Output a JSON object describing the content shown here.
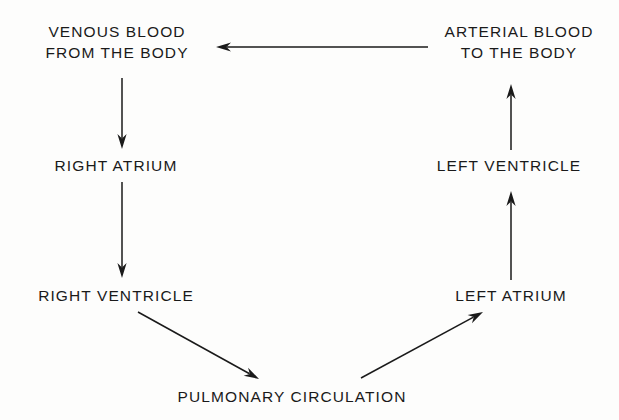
{
  "diagram": {
    "background_color": "#fdfdfc",
    "ink_color": "#1a1a1a",
    "nodes": [
      {
        "id": "venous-blood-from-the-body",
        "name": "node-venous-blood-from-the-body",
        "lines": [
          "VENOUS BLOOD",
          "FROM THE BODY"
        ],
        "text": "VENOUS BLOOD FROM THE BODY",
        "x": 117,
        "y": 42
      },
      {
        "id": "right-atrium",
        "name": "node-right-atrium",
        "lines": [
          "RIGHT ATRIUM"
        ],
        "text": "RIGHT ATRIUM",
        "x": 116,
        "y": 165
      },
      {
        "id": "right-ventricle",
        "name": "node-right-ventricle",
        "lines": [
          "RIGHT VENTRICLE"
        ],
        "text": "RIGHT VENTRICLE",
        "x": 116,
        "y": 295
      },
      {
        "id": "pulmonary-circulation",
        "name": "node-pulmonary-circulation",
        "lines": [
          "PULMONARY CIRCULATION"
        ],
        "text": "PULMONARY CIRCULATION",
        "x": 292,
        "y": 396
      },
      {
        "id": "left-atrium",
        "name": "node-left-atrium",
        "lines": [
          "LEFT ATRIUM"
        ],
        "text": "LEFT ATRIUM",
        "x": 511,
        "y": 295
      },
      {
        "id": "left-ventricle",
        "name": "node-left-ventricle",
        "lines": [
          "LEFT VENTRICLE"
        ],
        "text": "LEFT VENTRICLE",
        "x": 509,
        "y": 165
      },
      {
        "id": "arterial-blood-to-the-body",
        "name": "node-arterial-blood-to-the-body",
        "lines": [
          "ARTERIAL BLOOD",
          "TO THE BODY"
        ],
        "text": "ARTERIAL BLOOD TO THE BODY",
        "x": 519,
        "y": 42
      }
    ],
    "edges": [
      {
        "id": "venous-to-right-atrium",
        "name": "arrow-venous-blood-to-right-atrium",
        "from": "venous-blood-from-the-body",
        "to": "right-atrium",
        "x1": 122,
        "y1": 78,
        "x2": 122,
        "y2": 149
      },
      {
        "id": "right-atrium-to-right-ventricle",
        "name": "arrow-right-atrium-to-right-ventricle",
        "from": "right-atrium",
        "to": "right-ventricle",
        "x1": 122,
        "y1": 182,
        "x2": 122,
        "y2": 278
      },
      {
        "id": "right-ventricle-to-pulmonary",
        "name": "arrow-right-ventricle-to-pulmonary-circulation",
        "from": "right-ventricle",
        "to": "pulmonary-circulation",
        "x1": 138,
        "y1": 312,
        "x2": 259,
        "y2": 379
      },
      {
        "id": "pulmonary-to-left-atrium",
        "name": "arrow-pulmonary-circulation-to-left-atrium",
        "from": "pulmonary-circulation",
        "to": "left-atrium",
        "x1": 361,
        "y1": 378,
        "x2": 483,
        "y2": 312
      },
      {
        "id": "left-atrium-to-left-ventricle",
        "name": "arrow-left-atrium-to-left-ventricle",
        "from": "left-atrium",
        "to": "left-ventricle",
        "x1": 511,
        "y1": 280,
        "x2": 511,
        "y2": 191
      },
      {
        "id": "left-ventricle-to-arterial",
        "name": "arrow-left-ventricle-to-arterial-blood",
        "from": "left-ventricle",
        "to": "arterial-blood-to-the-body",
        "x1": 511,
        "y1": 150,
        "x2": 511,
        "y2": 84
      },
      {
        "id": "arterial-to-venous",
        "name": "arrow-arterial-blood-to-venous-blood",
        "from": "arterial-blood-to-the-body",
        "to": "venous-blood-from-the-body",
        "x1": 428,
        "y1": 47,
        "x2": 216,
        "y2": 47
      }
    ]
  }
}
